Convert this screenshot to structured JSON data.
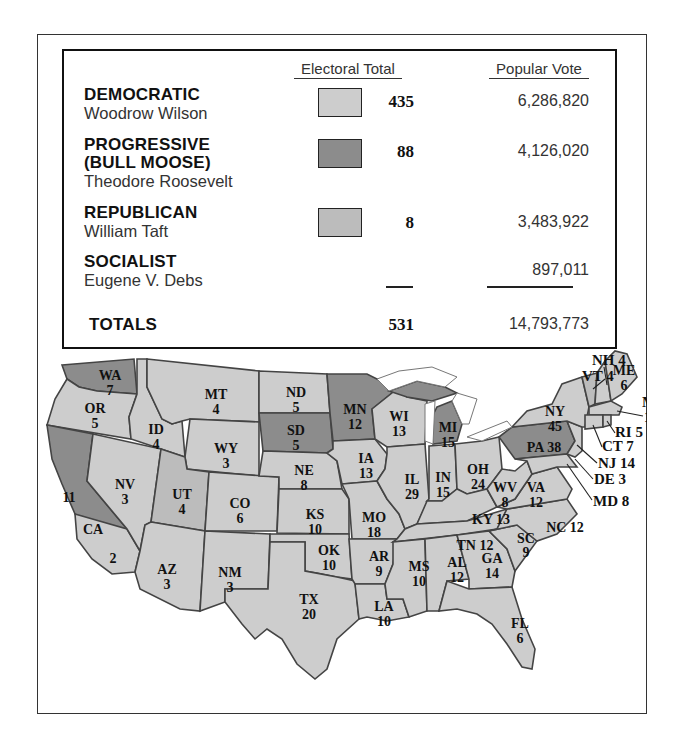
{
  "legend": {
    "headers": {
      "electoral": "Electoral Total",
      "popular": "Popular Vote"
    },
    "parties": [
      {
        "party": "DEMOCRATIC",
        "party_line2": "",
        "candidate": "Woodrow Wilson",
        "electoral": "435",
        "popular": "6,286,820",
        "color": "#cdcdcd"
      },
      {
        "party": "PROGRESSIVE",
        "party_line2": "(BULL MOOSE)",
        "candidate": "Theodore Roosevelt",
        "electoral": "88",
        "popular": "4,126,020",
        "color": "#8c8c8c"
      },
      {
        "party": "REPUBLICAN",
        "party_line2": "",
        "candidate": "William Taft",
        "electoral": "8",
        "popular": "3,483,922",
        "color": "#bcbcbc"
      },
      {
        "party": "SOCIALIST",
        "party_line2": "",
        "candidate": "Eugene V. Debs",
        "electoral": "",
        "popular": "897,011",
        "color": ""
      }
    ],
    "totals": {
      "label": "TOTALS",
      "electoral": "531",
      "popular": "14,793,773"
    }
  },
  "map": {
    "states": [
      {
        "abbr": "WA",
        "votes": "7",
        "winner": "Progressive"
      },
      {
        "abbr": "OR",
        "votes": "5",
        "winner": "Democratic"
      },
      {
        "abbr": "CA",
        "votes": "11",
        "winner": "Progressive"
      },
      {
        "abbr": "CA",
        "votes": "2",
        "winner": "Democratic"
      },
      {
        "abbr": "ID",
        "votes": "4",
        "winner": "Democratic"
      },
      {
        "abbr": "NV",
        "votes": "3",
        "winner": "Democratic"
      },
      {
        "abbr": "MT",
        "votes": "4",
        "winner": "Democratic"
      },
      {
        "abbr": "WY",
        "votes": "3",
        "winner": "Democratic"
      },
      {
        "abbr": "UT",
        "votes": "4",
        "winner": "Republican"
      },
      {
        "abbr": "CO",
        "votes": "6",
        "winner": "Democratic"
      },
      {
        "abbr": "AZ",
        "votes": "3",
        "winner": "Democratic"
      },
      {
        "abbr": "NM",
        "votes": "3",
        "winner": "Democratic"
      },
      {
        "abbr": "ND",
        "votes": "5",
        "winner": "Democratic"
      },
      {
        "abbr": "SD",
        "votes": "5",
        "winner": "Progressive"
      },
      {
        "abbr": "NE",
        "votes": "8",
        "winner": "Democratic"
      },
      {
        "abbr": "KS",
        "votes": "10",
        "winner": "Democratic"
      },
      {
        "abbr": "OK",
        "votes": "10",
        "winner": "Democratic"
      },
      {
        "abbr": "TX",
        "votes": "20",
        "winner": "Democratic"
      },
      {
        "abbr": "MN",
        "votes": "12",
        "winner": "Progressive"
      },
      {
        "abbr": "IA",
        "votes": "13",
        "winner": "Democratic"
      },
      {
        "abbr": "MO",
        "votes": "18",
        "winner": "Democratic"
      },
      {
        "abbr": "AR",
        "votes": "9",
        "winner": "Democratic"
      },
      {
        "abbr": "LA",
        "votes": "10",
        "winner": "Democratic"
      },
      {
        "abbr": "WI",
        "votes": "13",
        "winner": "Democratic"
      },
      {
        "abbr": "IL",
        "votes": "29",
        "winner": "Democratic"
      },
      {
        "abbr": "MI",
        "votes": "15",
        "winner": "Progressive"
      },
      {
        "abbr": "IN",
        "votes": "15",
        "winner": "Democratic"
      },
      {
        "abbr": "OH",
        "votes": "24",
        "winner": "Democratic"
      },
      {
        "abbr": "KY",
        "votes": "13",
        "winner": "Democratic"
      },
      {
        "abbr": "TN",
        "votes": "12",
        "winner": "Democratic"
      },
      {
        "abbr": "MS",
        "votes": "10",
        "winner": "Democratic"
      },
      {
        "abbr": "AL",
        "votes": "12",
        "winner": "Democratic"
      },
      {
        "abbr": "GA",
        "votes": "14",
        "winner": "Democratic"
      },
      {
        "abbr": "FL",
        "votes": "6",
        "winner": "Democratic"
      },
      {
        "abbr": "SC",
        "votes": "9",
        "winner": "Democratic"
      },
      {
        "abbr": "NC",
        "votes": "12",
        "winner": "Democratic"
      },
      {
        "abbr": "VA",
        "votes": "12",
        "winner": "Democratic"
      },
      {
        "abbr": "WV",
        "votes": "8",
        "winner": "Democratic"
      },
      {
        "abbr": "PA",
        "votes": "38",
        "winner": "Progressive"
      },
      {
        "abbr": "NY",
        "votes": "45",
        "winner": "Democratic"
      },
      {
        "abbr": "VT",
        "votes": "4",
        "winner": "Republican"
      },
      {
        "abbr": "NH",
        "votes": "4",
        "winner": "Democratic"
      },
      {
        "abbr": "ME",
        "votes": "6",
        "winner": "Democratic"
      },
      {
        "abbr": "MA",
        "votes": "18",
        "winner": "Democratic"
      },
      {
        "abbr": "RI",
        "votes": "5",
        "winner": "Democratic"
      },
      {
        "abbr": "CT",
        "votes": "7",
        "winner": "Democratic"
      },
      {
        "abbr": "NJ",
        "votes": "14",
        "winner": "Democratic"
      },
      {
        "abbr": "DE",
        "votes": "3",
        "winner": "Democratic"
      },
      {
        "abbr": "MD",
        "votes": "8",
        "winner": "Democratic"
      }
    ],
    "labels": {
      "WA": "WA",
      "WA_v": "7",
      "OR": "OR",
      "OR_v": "5",
      "CA": "CA",
      "CA_v1": "11",
      "CA_v2": "2",
      "ID": "ID",
      "ID_v": "4",
      "NV": "NV",
      "NV_v": "3",
      "MT": "MT",
      "MT_v": "4",
      "WY": "WY",
      "WY_v": "3",
      "UT": "UT",
      "UT_v": "4",
      "CO": "CO",
      "CO_v": "6",
      "AZ": "AZ",
      "AZ_v": "3",
      "NM": "NM",
      "NM_v": "3",
      "ND": "ND",
      "ND_v": "5",
      "SD": "SD",
      "SD_v": "5",
      "NE": "NE",
      "NE_v": "8",
      "KS": "KS",
      "KS_v": "10",
      "OK": "OK",
      "OK_v": "10",
      "TX": "TX",
      "TX_v": "20",
      "MN": "MN",
      "MN_v": "12",
      "IA": "IA",
      "IA_v": "13",
      "MO": "MO",
      "MO_v": "18",
      "AR": "AR",
      "AR_v": "9",
      "LA": "LA",
      "LA_v": "10",
      "WI": "WI",
      "WI_v": "13",
      "IL": "IL",
      "IL_v": "29",
      "MI": "MI",
      "MI_v": "15",
      "IN": "IN",
      "IN_v": "15",
      "OH": "OH",
      "OH_v": "24",
      "KY": "KY 13",
      "TN": "TN 12",
      "MS": "MS",
      "MS_v": "10",
      "AL": "AL",
      "AL_v": "12",
      "GA": "GA",
      "GA_v": "14",
      "FL": "FL",
      "FL_v": "6",
      "SC": "SC",
      "SC_v": "9",
      "NC": "NC 12",
      "VA": "VA",
      "VA_v": "12",
      "WV": "WV",
      "WV_v": "8",
      "PA": "PA 38",
      "NY": "NY",
      "NY_v": "45",
      "VT": "VT 4",
      "NH": "NH 4",
      "ME": "ME",
      "ME_v": "6",
      "MA": "MA",
      "MA_v": "18",
      "RI": "RI 5",
      "CT": "CT 7",
      "NJ": "NJ 14",
      "DE": "DE 3",
      "MD": "MD 8"
    }
  }
}
